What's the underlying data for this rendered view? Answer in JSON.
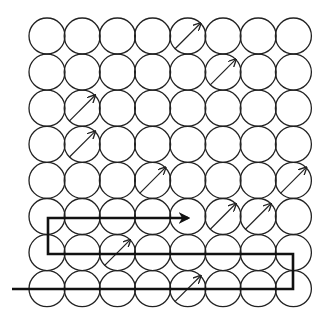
{
  "diagram": {
    "rows": 8,
    "cols": 8,
    "origin": {
      "x": 47,
      "y": 36
    },
    "pitch": {
      "x": 35.2,
      "y": 36.1
    },
    "radius": 18,
    "stroke_color": "#222222",
    "path_color": "#111111",
    "arrow_cells": [
      {
        "row": 0,
        "col": 4
      },
      {
        "row": 1,
        "col": 5
      },
      {
        "row": 2,
        "col": 1
      },
      {
        "row": 3,
        "col": 1
      },
      {
        "row": 4,
        "col": 3
      },
      {
        "row": 4,
        "col": 7
      },
      {
        "row": 5,
        "col": 5
      },
      {
        "row": 5,
        "col": 6
      },
      {
        "row": 6,
        "col": 2
      },
      {
        "row": 7,
        "col": 4
      }
    ],
    "path_points": [
      [
        12,
        289
      ],
      [
        293,
        289
      ],
      [
        293,
        254
      ],
      [
        48,
        254
      ],
      [
        48,
        218
      ],
      [
        188,
        218
      ]
    ]
  }
}
